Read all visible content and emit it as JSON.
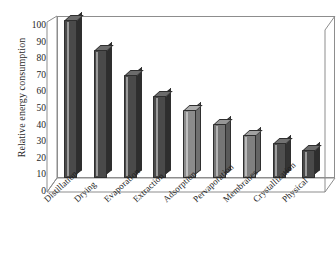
{
  "chart_data": {
    "type": "bar",
    "title": "",
    "xlabel": "",
    "ylabel": "Relative energy consumption",
    "ylim": [
      0,
      100
    ],
    "yticks": [
      0,
      10,
      20,
      30,
      40,
      50,
      60,
      70,
      80,
      90,
      100
    ],
    "grid": false,
    "legend": "none",
    "style": "3d-bars",
    "categories": [
      "Distillation",
      "Drying",
      "Evaporation",
      "Extraction",
      "Adsorption",
      "Pervaporation",
      "Membranes",
      "Crystallization",
      "Physical"
    ],
    "values": [
      100,
      81,
      65,
      52,
      43,
      34,
      27,
      22,
      18
    ],
    "bar_colors": [
      "#4a4a4a",
      "#4a4a4a",
      "#4a4a4a",
      "#4a4a4a",
      "#8b8b8b",
      "#757575",
      "#808080",
      "#4f4f4f",
      "#4a4a4a"
    ]
  },
  "axes": {
    "frame_color": "#8d8d8d",
    "text_color": "#1e1e1e",
    "background": "#ffffff"
  }
}
